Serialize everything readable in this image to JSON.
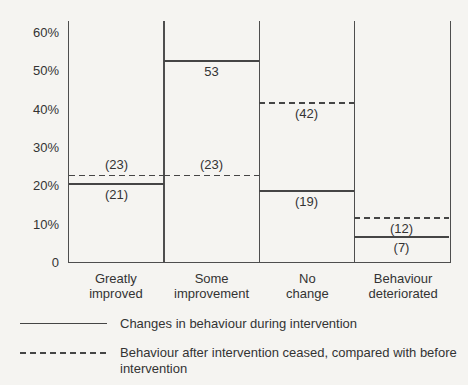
{
  "colors": {
    "background": "#f5f4f1",
    "line": "#454545",
    "frame": "#4e4e4e",
    "text": "#333333"
  },
  "chart_data": {
    "type": "bar",
    "title": "",
    "xlabel": "",
    "ylabel": "",
    "categories": [
      "Greatly improved",
      "Some improvement",
      "No change",
      "Behaviour deteriorated"
    ],
    "categories_display": [
      "Greatly\nimproved",
      "Some\nimprovement",
      "No\nchange",
      "Behaviour\ndeteriorated"
    ],
    "series": [
      {
        "name": "Changes in behaviour during intervention",
        "line_style": "solid",
        "values": [
          21,
          53,
          19,
          7
        ],
        "value_labels": [
          "(21)",
          "53",
          "(19)",
          "(7)"
        ],
        "label_positions": [
          "below",
          "below",
          "below",
          "below"
        ]
      },
      {
        "name": "Behaviour after intervention ceased, compared with before intervention",
        "line_style": "dashed",
        "values": [
          23,
          23,
          42,
          12
        ],
        "value_labels": [
          "(23)",
          "(23)",
          "(42)",
          "(12)"
        ],
        "label_positions": [
          "above",
          "above",
          "below",
          "below"
        ]
      }
    ],
    "ylim": [
      0,
      60
    ],
    "ytick_values": [
      0,
      10,
      20,
      30,
      40,
      50,
      60
    ],
    "ytick_labels": [
      "0",
      "10%",
      "20%",
      "30%",
      "40%",
      "50%",
      "60%"
    ],
    "grid": false,
    "legend_position": "below"
  }
}
